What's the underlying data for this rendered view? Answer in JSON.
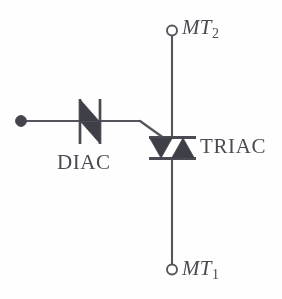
{
  "diagram": {
    "ink_color": "#4a4a52",
    "wire_color": "#55555d",
    "fill_color": "#3f3f47",
    "background": "#fefefe",
    "labels": {
      "diac": "DIAC",
      "triac": "TRIAC",
      "mt2_base": "MT",
      "mt2_sub": "2",
      "mt1_base": "MT",
      "mt1_sub": "1"
    },
    "terminals": [
      {
        "name": "input-terminal",
        "type": "filled-dot",
        "x": 20,
        "y": 121
      },
      {
        "name": "mt2-terminal",
        "type": "open-circle",
        "x": 172,
        "y": 30
      },
      {
        "name": "mt1-terminal",
        "type": "open-circle",
        "x": 172,
        "y": 270
      }
    ],
    "components": [
      {
        "name": "diac",
        "type": "diac-symbol",
        "x": 90,
        "y": 121
      },
      {
        "name": "triac",
        "type": "triac-symbol",
        "x": 172,
        "y": 148
      }
    ],
    "wires": [
      {
        "name": "input-wire",
        "from": [
          20,
          121
        ],
        "to": [
          78,
          121
        ]
      },
      {
        "name": "diac-gate-wire",
        "from": [
          102,
          121
        ],
        "to": [
          140,
          121
        ]
      },
      {
        "name": "gate-diagonal-wire",
        "from": [
          140,
          121
        ],
        "to": [
          167,
          141
        ]
      },
      {
        "name": "mt2-wire",
        "from": [
          172,
          36
        ],
        "to": [
          172,
          136
        ]
      },
      {
        "name": "mt1-wire",
        "from": [
          172,
          160
        ],
        "to": [
          172,
          264
        ]
      }
    ]
  }
}
